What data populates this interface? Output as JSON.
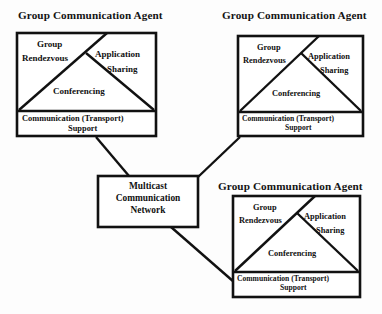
{
  "diagram": {
    "background_color": "#fdfdfd",
    "line_color": "#111111",
    "text_color": "#111111"
  },
  "agents": [
    {
      "id": "agent-top-left",
      "title": "Group Communication Agent",
      "components": {
        "rendezvous_line1": "Group",
        "rendezvous_line2": "Rendezvous",
        "application_line1": "Application",
        "application_line2": "Sharing",
        "conferencing": "Conferencing",
        "transport_line1": "Communication (Transport)",
        "transport_line2": "Support"
      }
    },
    {
      "id": "agent-top-right",
      "title": "Group Communication Agent",
      "components": {
        "rendezvous_line1": "Group",
        "rendezvous_line2": "Rendezvous",
        "application_line1": "Application",
        "application_line2": "Sharing",
        "conferencing": "Conferencing",
        "transport_line1": "Communication (Transport)",
        "transport_line2": "Support"
      }
    },
    {
      "id": "agent-bottom-right",
      "title": "Group Communication Agent",
      "components": {
        "rendezvous_line1": "Group",
        "rendezvous_line2": "Rendezvous",
        "application_line1": "Application",
        "application_line2": "Sharing",
        "conferencing": "Conferencing",
        "transport_line1": "Communication (Transport)",
        "transport_line2": "Support"
      }
    }
  ],
  "network": {
    "id": "multicast-network",
    "line1": "Multicast",
    "line2": "Communication",
    "line3": "Network"
  },
  "connections": [
    {
      "from": "agent-top-left",
      "to": "multicast-network"
    },
    {
      "from": "agent-top-right",
      "to": "multicast-network"
    },
    {
      "from": "agent-bottom-right",
      "to": "multicast-network"
    }
  ]
}
